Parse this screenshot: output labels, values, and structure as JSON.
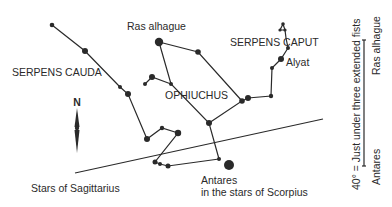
{
  "diagram": {
    "type": "star-chart",
    "ink_color": "#2a2a2a",
    "background": "#ffffff",
    "labels": {
      "serpens_cauda": "SERPENS CAUDA",
      "ras_alhague": "Ras alhague",
      "serpens_caput": "SERPENS CAPUT",
      "alyat": "Alyat",
      "ophiuchus": "OPHIUCHUS",
      "antares": "Antares",
      "scorpius": "in the stars of Scorpius",
      "sagittarius": "Stars of Sagittarius",
      "compass_north": "N"
    },
    "scale": {
      "caption": "40° = Just under three extended fists",
      "top_label": "Ras alhague",
      "bottom_label": "Antares"
    }
  }
}
